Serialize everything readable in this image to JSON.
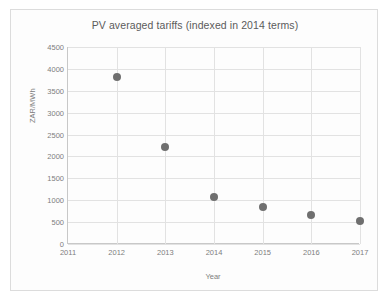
{
  "chart_data": {
    "type": "scatter",
    "title": "PV averaged tariffs (indexed in 2014 terms)",
    "xlabel": "Year",
    "ylabel": "ZAR/MWh",
    "xlim": [
      2011,
      2017
    ],
    "ylim": [
      0,
      4500
    ],
    "xticks": [
      "2011",
      "2012",
      "2013",
      "2014",
      "2015",
      "2016",
      "2017"
    ],
    "yticks": [
      "0",
      "500",
      "1000",
      "1500",
      "2000",
      "2500",
      "3000",
      "3500",
      "4000",
      "4500"
    ],
    "grid": true,
    "legend": false,
    "marker_color": "#6f6f6f",
    "series": [
      {
        "name": "PV averaged tariff",
        "x": [
          2012,
          2013,
          2014,
          2015,
          2016,
          2017
        ],
        "values": [
          3820,
          2215,
          1070,
          840,
          660,
          520
        ]
      }
    ]
  }
}
